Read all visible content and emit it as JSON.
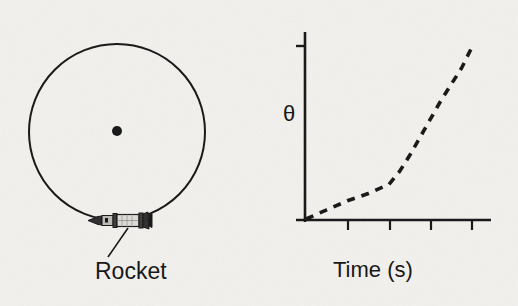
{
  "figure": {
    "left_panel": {
      "name": "circular-track-diagram",
      "annotation_label": "Rocket",
      "center_dot": true,
      "circle": {
        "cx": 117,
        "cy": 132,
        "r": 88
      },
      "rocket_position_deg": 270
    },
    "right_panel": {
      "name": "theta-vs-time-graph",
      "x_axis_title": "Time (s)",
      "y_axis_title": "θ",
      "x_tick_labels": [
        "1",
        "2",
        "3",
        "4"
      ]
    }
  },
  "chart_data": {
    "type": "line",
    "title": "",
    "xlabel": "Time (s)",
    "ylabel": "θ",
    "xlim": [
      0,
      4.45
    ],
    "ylim": [
      0,
      1.0
    ],
    "xticks": [
      1,
      2,
      3,
      4
    ],
    "xticklabels": [
      "1",
      "2",
      "3",
      "4"
    ],
    "yticks": [
      0.95
    ],
    "yticklabels": [
      ""
    ],
    "grid": false,
    "legend": null,
    "linestyle": "dashed",
    "color": "#141414",
    "series": [
      {
        "name": "theta",
        "x": [
          0.0,
          0.5,
          1.0,
          1.5,
          2.0,
          2.25,
          2.5,
          2.75,
          3.0,
          3.25,
          3.5,
          3.75,
          4.0
        ],
        "y": [
          0.0,
          0.05,
          0.1,
          0.14,
          0.19,
          0.26,
          0.35,
          0.45,
          0.55,
          0.65,
          0.74,
          0.83,
          0.945
        ]
      }
    ],
    "annotations": [
      "linear segment from t=0 to t=2",
      "steeper, slightly curved segment from t=2 to t=4"
    ]
  },
  "colors": {
    "ink": "#141414",
    "paper": "#f2f1ee",
    "rocket_body": "#d8d6d2"
  }
}
